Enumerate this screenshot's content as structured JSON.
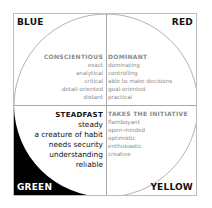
{
  "quadrants": {
    "blue": {
      "label": "BLUE",
      "heading": "CONSCIENTIOUS",
      "traits": [
        "exact",
        "analytical",
        "critical",
        "detail-oriented",
        "distant"
      ]
    },
    "red": {
      "label": "RED",
      "heading": "DOMINANT",
      "traits": [
        "dominating",
        "controlling",
        "able to make decisions",
        "goal-oriented",
        "practical"
      ]
    },
    "green": {
      "label": "GREEN",
      "heading": "STEADFAST",
      "traits": [
        "steady",
        "a creature of habit",
        "needs security",
        "understanding",
        "reliable"
      ]
    },
    "yellow": {
      "label": "YELLOW",
      "heading": "TAKES THE INITIATIVE",
      "traits": [
        "flamboyant",
        "open-minded",
        "optimistic",
        "enthusiastic",
        "creative"
      ]
    }
  },
  "colors": {
    "frame": "#bdbdbd",
    "divider": "#a9a9a9",
    "arc": "#a0a0a0",
    "fill_green": "#000000",
    "emphasis_text": "#111111",
    "muted_text": "#8a8a8a"
  }
}
